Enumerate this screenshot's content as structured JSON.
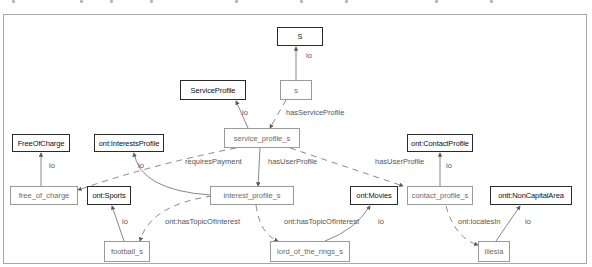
{
  "diagram": {
    "nodes": [
      {
        "id": "S",
        "label": "S",
        "kind": "class"
      },
      {
        "id": "s",
        "label": "s",
        "kind": "instance"
      },
      {
        "id": "ServiceProfile",
        "label": "ServiceProfile",
        "kind": "class"
      },
      {
        "id": "service_profile_s",
        "label": "service_profile_s",
        "kind": "instance"
      },
      {
        "id": "FreeOfCharge",
        "label": "FreeOfCharge",
        "kind": "class"
      },
      {
        "id": "InterestsProfile",
        "label": "ont:InterestsProfile",
        "kind": "class"
      },
      {
        "id": "ContactProfile",
        "label": "ont:ContactProfile",
        "kind": "class"
      },
      {
        "id": "free_of_charge",
        "label": "free_of_charge",
        "kind": "instance"
      },
      {
        "id": "Sports",
        "label": "ont:Sports",
        "kind": "class"
      },
      {
        "id": "interest_profile_s",
        "label": "interest_profile_s",
        "kind": "instance"
      },
      {
        "id": "Movies",
        "label": "ont:Movies",
        "kind": "class"
      },
      {
        "id": "contact_profile_s",
        "label": "contact_profile_s",
        "kind": "instance"
      },
      {
        "id": "NonCapitalArea",
        "label": "ontt:NonCapitalArea",
        "kind": "class"
      },
      {
        "id": "football_s",
        "label": "football_s",
        "kind": "instance"
      },
      {
        "id": "lord_of_the_rings_s",
        "label": "lord_of_the_rings_s",
        "kind": "instance"
      },
      {
        "id": "illesia",
        "label": "illesia",
        "kind": "instance"
      }
    ],
    "edges": [
      {
        "from": "s",
        "to": "S",
        "label": "io",
        "style": "solid"
      },
      {
        "from": "service_profile_s",
        "to": "ServiceProfile",
        "label": "io",
        "style": "solid"
      },
      {
        "from": "s",
        "to": "service_profile_s",
        "label": "hasServiceProfile",
        "style": "dashed"
      },
      {
        "from": "free_of_charge",
        "to": "FreeOfCharge",
        "label": "io",
        "style": "solid"
      },
      {
        "from": "service_profile_s",
        "to": "free_of_charge",
        "label": "requiresPayment",
        "style": "dashed"
      },
      {
        "from": "service_profile_s",
        "to": "interest_profile_s",
        "label": "hasUserProfile",
        "style": "solid"
      },
      {
        "from": "service_profile_s",
        "to": "contact_profile_s",
        "label": "hasUserProfile",
        "style": "dashed"
      },
      {
        "from": "interest_profile_s",
        "to": "InterestsProfile",
        "label": "io",
        "style": "solid"
      },
      {
        "from": "contact_profile_s",
        "to": "ContactProfile",
        "label": "io",
        "style": "solid"
      },
      {
        "from": "football_s",
        "to": "Sports",
        "label": "io",
        "style": "solid"
      },
      {
        "from": "interest_profile_s",
        "to": "football_s",
        "label": "ont:hasTopicOfInterest",
        "style": "dashed"
      },
      {
        "from": "interest_profile_s",
        "to": "lord_of_the_rings_s",
        "label": "ont:hasTopicOfInterest",
        "style": "dashed"
      },
      {
        "from": "lord_of_the_rings_s",
        "to": "Movies",
        "label": "io",
        "style": "solid"
      },
      {
        "from": "contact_profile_s",
        "to": "illesia",
        "label": "ont:locatesIn",
        "style": "dashed"
      },
      {
        "from": "illesia",
        "to": "NonCapitalArea",
        "label": "io",
        "style": "solid"
      }
    ]
  },
  "colors": {
    "class_border": "#2a2a2a",
    "instance_border": "#9a9a9a",
    "edge": "#7a7a7a",
    "frame": "#a8a8a8"
  }
}
